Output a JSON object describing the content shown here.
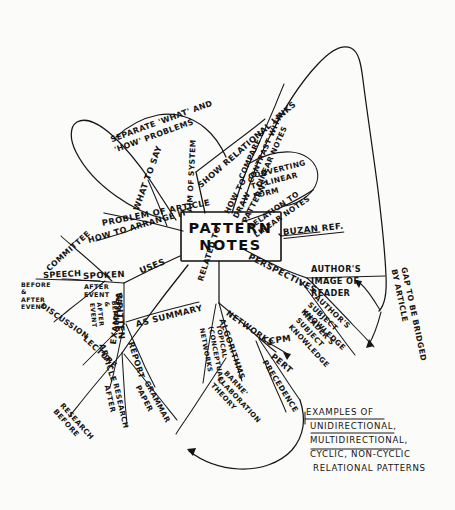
{
  "meta": {
    "title": "Pattern Notes",
    "ink_color": "#151515",
    "paper_color": "#fbfbfa"
  },
  "center": {
    "line1": "PATTERN",
    "line2": "NOTES"
  },
  "branches": {
    "problem": {
      "root": "PROBLEM OF ARTICLE",
      "children": [
        "SEPARATE 'WHAT' AND 'HOW' PROBLEMS",
        "WHAT TO SAY",
        "HOW TO ARRANGE IT"
      ]
    },
    "aim": {
      "root": "AIM OF SYSTEM",
      "children": [
        "SHOW RELATIONAL LINKS"
      ]
    },
    "howto": {
      "root": "HOW TO DRAW PATTERNS",
      "children": [
        "COMPARE & CONTRAST WITH LINEAR NOTES",
        "CONVERTING TO LINEAR FORM"
      ]
    },
    "relation": {
      "root": "RELATION TO LINEAR NOTES",
      "children": [
        "BUZAN REF."
      ]
    },
    "perspectives": {
      "root": "PERSPECTIVES",
      "children": [
        "AUTHOR'S IMAGE OF READER",
        "AUTHOR'S SUBJECT KNOWLEDGE",
        "READER'S SUBJECT KNOWLEDGE"
      ],
      "annotation": "GAP TO BE BRIDGED BY ARTICLE"
    },
    "related": {
      "root": "RELATED TO",
      "children": [
        "NETWORKS",
        "ALGORITHMS",
        "TOPICAL (CONCEPTUAL) NETWORKS",
        "CPM",
        "PERT",
        "PRECEDENCE",
        "BARNE' ELABORATION THEORY"
      ]
    },
    "uses": {
      "root": "USES",
      "spoken": {
        "label": "SPOKEN",
        "children": [
          "COMMITTEE",
          "DISCUSSION",
          "SPEECH"
        ],
        "notes": [
          "BEFORE & AFTER EVENT",
          "AFTER EVENT"
        ]
      },
      "written": {
        "label": "WRITTEN",
        "note": "BEFORE & AFTER EVENT",
        "children": [
          "LECTURE",
          "ARTICLE",
          "REPORT",
          "AS SUMMARY"
        ]
      }
    },
    "examples": {
      "root": "EXAMPLES",
      "children": [
        "RESEARCH BEFORE",
        "RESEARCH AFTER",
        "GRAMMAR PAPER"
      ]
    }
  },
  "caption": {
    "heading": "EXAMPLES OF",
    "lines": [
      "UNIDIRECTIONAL,",
      "MULTIDIRECTIONAL,",
      "CYCLIC, NON-CYCLIC",
      "RELATIONAL PATTERNS"
    ]
  }
}
